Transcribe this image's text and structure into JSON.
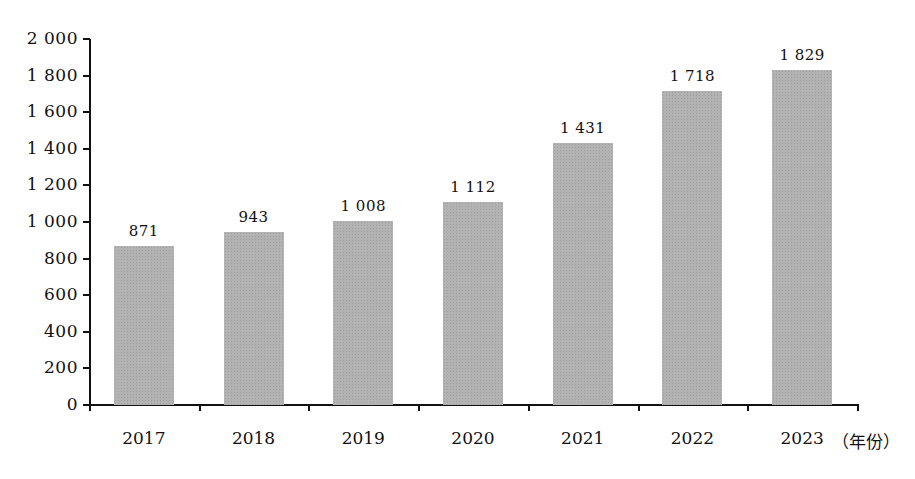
{
  "chart_data": {
    "type": "bar",
    "title": "",
    "xlabel": "（年份）",
    "ylabel": "",
    "categories": [
      "2017",
      "2018",
      "2019",
      "2020",
      "2021",
      "2022",
      "2023"
    ],
    "values": [
      871,
      943,
      1008,
      1112,
      1431,
      1718,
      1829
    ],
    "value_labels": [
      "871",
      "943",
      "1 008",
      "1 112",
      "1 431",
      "1 718",
      "1 829"
    ],
    "ylim": [
      0,
      2000
    ],
    "yticks": [
      0,
      200,
      400,
      600,
      800,
      1000,
      1200,
      1400,
      1600,
      1800,
      2000
    ],
    "ytick_labels": [
      "0",
      "200",
      "400",
      "600",
      "800",
      "1 000",
      "1 200",
      "1 400",
      "1 600",
      "1 800",
      "2 000"
    ],
    "grid": false,
    "legend": null,
    "bar_color": "#b3b3b3"
  }
}
